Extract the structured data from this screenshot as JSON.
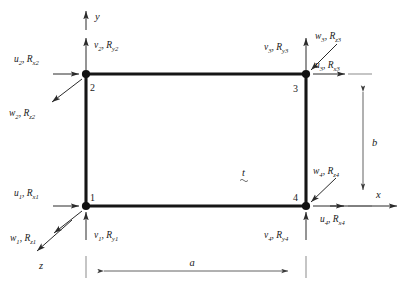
{
  "figure": {
    "element_shape": "rectangle",
    "thickness_label": "t",
    "dimension_width_label": "a",
    "dimension_height_label": "b",
    "axes": {
      "x_label": "x",
      "y_label": "y",
      "z_label": "z"
    },
    "nodes": [
      {
        "id": "1",
        "number": "1",
        "corner": "bottom-left",
        "u_base": "u",
        "u_sub": "1",
        "rx_base": "R",
        "rx_sub": "x1",
        "v_base": "v",
        "v_sub": "1",
        "ry_base": "R",
        "ry_sub": "y1",
        "w_base": "w",
        "w_sub": "1",
        "rz_base": "R",
        "rz_sub": "z1",
        "u_label": "u1, Rx1",
        "v_label": "v1, Ry1",
        "w_label": "w1, Rz1"
      },
      {
        "id": "2",
        "number": "2",
        "corner": "top-left",
        "u_base": "u",
        "u_sub": "2",
        "rx_base": "R",
        "rx_sub": "x2",
        "v_base": "v",
        "v_sub": "2",
        "ry_base": "R",
        "ry_sub": "y2",
        "w_base": "w",
        "w_sub": "2",
        "rz_base": "R",
        "rz_sub": "z2",
        "u_label": "u2, Rx2",
        "v_label": "v2, Ry2",
        "w_label": "w2, Rz2"
      },
      {
        "id": "3",
        "number": "3",
        "corner": "top-right",
        "u_base": "u",
        "u_sub": "3",
        "rx_base": "R",
        "rx_sub": "x3",
        "v_base": "v",
        "v_sub": "3",
        "ry_base": "R",
        "ry_sub": "y3",
        "w_base": "w",
        "w_sub": "3",
        "rz_base": "R",
        "rz_sub": "z3",
        "u_label": "u3, Rx3",
        "v_label": "v3, Ry3",
        "w_label": "w3, Rz3"
      },
      {
        "id": "4",
        "number": "4",
        "corner": "bottom-right",
        "u_base": "u",
        "u_sub": "4",
        "rx_base": "R",
        "rx_sub": "x4",
        "v_base": "v",
        "v_sub": "4",
        "ry_base": "R",
        "ry_sub": "y4",
        "w_base": "w",
        "w_sub": "4",
        "rz_base": "R",
        "rz_sub": "z4",
        "u_label": "u4, Rx4",
        "v_label": "v4, Ry4",
        "w_label": "w4, Rz4"
      }
    ],
    "separator": ", ",
    "colors": {
      "background": "#ffffff",
      "edge": "#161616",
      "node": "#111111",
      "arrow": "#2a2a2a",
      "dimension": "#3a3a3a",
      "text": "#1a1a1a"
    }
  }
}
